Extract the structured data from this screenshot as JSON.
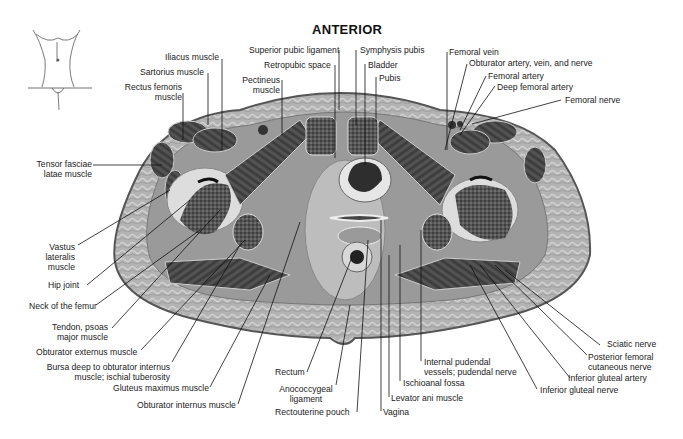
{
  "figure": {
    "orientation_label": "ANTERIOR",
    "labels": {
      "iliacus": "Iliacus muscle",
      "sartorius": "Sartorius muscle",
      "rectus_femoris_1": "Rectus femoris",
      "rectus_femoris_2": "muscle",
      "superior_pubic_ligament": "Superior pubic ligament",
      "symphysis_pubis": "Symphysis pubis",
      "retropubic_space": "Retropubic space",
      "bladder": "Bladder",
      "pectineus_1": "Pectineus",
      "pectineus_2": "muscle",
      "pubis": "Pubis",
      "femoral_vein": "Femoral vein",
      "obturator_avn": "Obturator artery, vein, and nerve",
      "femoral_artery": "Femoral artery",
      "deep_femoral_artery": "Deep femoral artery",
      "femoral_nerve": "Femoral nerve",
      "tensor_1": "Tensor fasciae",
      "tensor_2": "latae muscle",
      "vastus_1": "Vastus",
      "vastus_2": "lateralis",
      "vastus_3": "muscle",
      "hip_joint": "Hip joint",
      "neck_femur": "Neck of the femur",
      "tendon_psoas_1": "Tendon, psoas",
      "tendon_psoas_2": "major muscle",
      "obturator_externus": "Obturator externus muscle",
      "bursa_1": "Bursa deep to obturator internus",
      "bursa_2": "muscle; ischial tuberosity",
      "gluteus_maximus": "Gluteus maximus muscle",
      "obturator_internus": "Obturator internus muscle",
      "rectum": "Rectum",
      "anococcygeal_1": "Anococcygeal",
      "anococcygeal_2": "ligament",
      "rectouterine_pouch": "Rectouterine pouch",
      "vagina": "Vagina",
      "levator_ani": "Levator ani muscle",
      "ischioanal_fossa": "Ischioanal fossa",
      "internal_pudendal_1": "Internal pudendal",
      "internal_pudendal_2": "vessels; pudendal nerve",
      "sciatic_nerve": "Sciatic nerve",
      "post_femoral_1": "Posterior femoral",
      "post_femoral_2": "cutaneous nerve",
      "inferior_gluteal_artery": "Inferior gluteal artery",
      "inferior_gluteal_nerve": "Inferior gluteal nerve"
    }
  }
}
